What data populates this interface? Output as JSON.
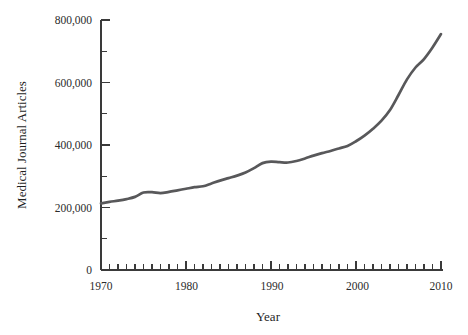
{
  "chart_data": {
    "type": "line",
    "title": "",
    "xlabel": "Year",
    "ylabel": "Medical Journal Articles",
    "xlim": [
      1970,
      2010
    ],
    "ylim": [
      0,
      800000
    ],
    "grid": false,
    "legend": false,
    "legend_position": "none",
    "x_major_ticks": [
      1970,
      1980,
      1990,
      2000,
      2010
    ],
    "x_major_tick_labels": [
      "1970",
      "1980",
      "1990",
      "2000",
      "2010"
    ],
    "x_minor_tick_interval": 1,
    "y_major_ticks": [
      0,
      200000,
      400000,
      600000,
      800000
    ],
    "y_major_tick_labels": [
      "0",
      "200,000",
      "400,000",
      "600,000",
      "800,000"
    ],
    "y_minor_ticks": [
      100000,
      300000,
      500000,
      700000
    ],
    "line_color": "#58585a",
    "axis_color": "#3a3a3a",
    "x": [
      1970,
      1971,
      1972,
      1973,
      1974,
      1975,
      1976,
      1977,
      1978,
      1979,
      1980,
      1981,
      1982,
      1983,
      1984,
      1985,
      1986,
      1987,
      1988,
      1989,
      1990,
      1991,
      1992,
      1993,
      1994,
      1995,
      1996,
      1997,
      1998,
      1999,
      2000,
      2001,
      2002,
      2003,
      2004,
      2005,
      2006,
      2007,
      2008,
      2009,
      2010
    ],
    "values": [
      213000,
      218000,
      222000,
      227000,
      234000,
      248000,
      249000,
      246000,
      250000,
      255000,
      260000,
      265000,
      268000,
      277000,
      286000,
      294000,
      302000,
      312000,
      326000,
      342000,
      347000,
      345000,
      344000,
      349000,
      357000,
      366000,
      374000,
      381000,
      389000,
      397000,
      412000,
      430000,
      452000,
      478000,
      512000,
      560000,
      610000,
      648000,
      675000,
      712000,
      755000
    ]
  },
  "axis": {
    "ylabel": "Medical Journal Articles",
    "xlabel": "Year",
    "y_labels": {
      "t800": "800,000",
      "t600": "600,000",
      "t400": "400,000",
      "t200": "200,000",
      "t0": "0"
    },
    "x_labels": {
      "t1970": "1970",
      "t1980": "1980",
      "t1990": "1990",
      "t2000": "2000",
      "t2010": "2010"
    }
  }
}
